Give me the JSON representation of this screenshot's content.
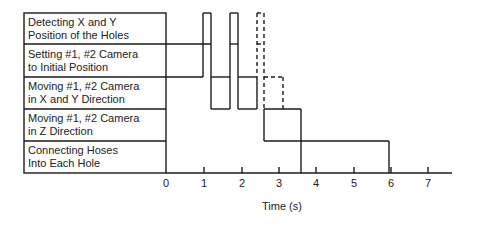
{
  "diagram": {
    "type": "timing-diagram",
    "rows": [
      {
        "label_line1": "Detecting X and Y",
        "label_line2": "Position of the Holes"
      },
      {
        "label_line1": "Setting #1, #2 Camera",
        "label_line2": "to Initial Position"
      },
      {
        "label_line1": "Moving #1, #2 Camera",
        "label_line2": "in X and Y Direction"
      },
      {
        "label_line1": "Moving #1, #2 Camera",
        "label_line2": "in Z Direction"
      },
      {
        "label_line1": "Connecting Hoses",
        "label_line2": "Into Each Hole"
      }
    ],
    "x_axis": {
      "title": "Time (s)",
      "ticks": [
        "0",
        "1",
        "2",
        "3",
        "4",
        "5",
        "6",
        "7"
      ],
      "range": [
        0,
        7.5
      ]
    },
    "line_color": "#1a1a1a",
    "events": [
      {
        "row": "Detecting X and Y Position of the Holes",
        "start_s": 1.0,
        "end_s": 1.2,
        "style": "solid"
      },
      {
        "row": "Setting #1, #2 Camera to Initial Position",
        "start_s": 0.0,
        "end_s": 1.0,
        "style": "solid"
      },
      {
        "row": "Moving #1, #2 Camera in X and Y Direction",
        "start_s": 1.2,
        "end_s": 1.7,
        "style": "solid"
      },
      {
        "row": "Detecting X and Y Position of the Holes",
        "start_s": 1.7,
        "end_s": 1.9,
        "style": "solid"
      },
      {
        "row": "Moving #1, #2 Camera in X and Y Direction",
        "start_s": 1.9,
        "end_s": 2.4,
        "style": "solid"
      },
      {
        "row": "Detecting X and Y Position of the Holes",
        "start_s": 2.4,
        "end_s": 2.6,
        "style": "dashed"
      },
      {
        "row": "Moving #1, #2 Camera in X and Y Direction",
        "start_s": 2.6,
        "end_s": 3.1,
        "style": "dashed"
      },
      {
        "row": "Moving #1, #2 Camera in Z Direction",
        "start_s": 2.6,
        "end_s": 3.6,
        "style": "solid"
      },
      {
        "row": "Connecting Hoses Into Each Hole",
        "start_s": 2.6,
        "end_s": 6.6,
        "style": "solid"
      }
    ]
  }
}
